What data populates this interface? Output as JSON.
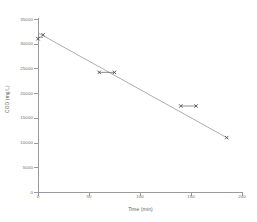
{
  "chart_data": {
    "type": "scatter",
    "title": "",
    "xlabel": "Time (min)",
    "ylabel": "COD (mg/L)",
    "xlim": [
      0,
      200
    ],
    "ylim": [
      0,
      35000
    ],
    "xticks": [
      0,
      50,
      100,
      150,
      200
    ],
    "xtick_labels": [
      "0",
      "50",
      "100",
      "150",
      "200"
    ],
    "yticks": [
      0,
      5000,
      10000,
      15000,
      20000,
      25000,
      30000,
      35000
    ],
    "ytick_labels": [
      "0",
      "5000",
      "10000",
      "15000",
      "20000",
      "25000",
      "30000",
      "35000"
    ],
    "grid": false,
    "legend": "none",
    "marker": "x",
    "marker_color": "#4a4a4a",
    "line_color": "#8a8a8a",
    "series": [
      {
        "name": "COD",
        "points": [
          {
            "x": 0,
            "y": 31000
          },
          {
            "x": 5,
            "y": 31800
          },
          {
            "x": 60,
            "y": 24200
          },
          {
            "x": 75,
            "y": 24200
          },
          {
            "x": 140,
            "y": 17400
          },
          {
            "x": 155,
            "y": 17400
          },
          {
            "x": 185,
            "y": 11000
          }
        ]
      }
    ],
    "trendline": {
      "visible": true,
      "x_start": 0,
      "y_start": 32200,
      "x_end": 185,
      "y_end": 11000
    },
    "connectors": [
      {
        "x_start": 0,
        "x_end": 5,
        "y": 31300
      },
      {
        "x_start": 60,
        "x_end": 75,
        "y": 24200
      },
      {
        "x_start": 140,
        "x_end": 155,
        "y": 17400
      }
    ]
  }
}
